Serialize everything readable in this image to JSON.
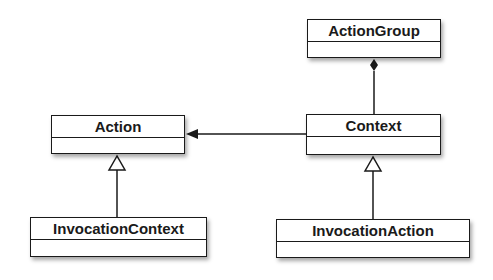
{
  "diagram": {
    "type": "UML class diagram",
    "classes": [
      {
        "id": "action_group",
        "name": "ActionGroup"
      },
      {
        "id": "context",
        "name": "Context"
      },
      {
        "id": "action",
        "name": "Action"
      },
      {
        "id": "invocation_context",
        "name": "InvocationContext"
      },
      {
        "id": "invocation_action",
        "name": "InvocationAction"
      }
    ],
    "relationships": [
      {
        "from": "Context",
        "to": "ActionGroup",
        "type": "composition"
      },
      {
        "from": "Context",
        "to": "Action",
        "type": "directed-association"
      },
      {
        "from": "InvocationContext",
        "to": "Action",
        "type": "generalization"
      },
      {
        "from": "InvocationAction",
        "to": "Context",
        "type": "generalization"
      }
    ]
  }
}
